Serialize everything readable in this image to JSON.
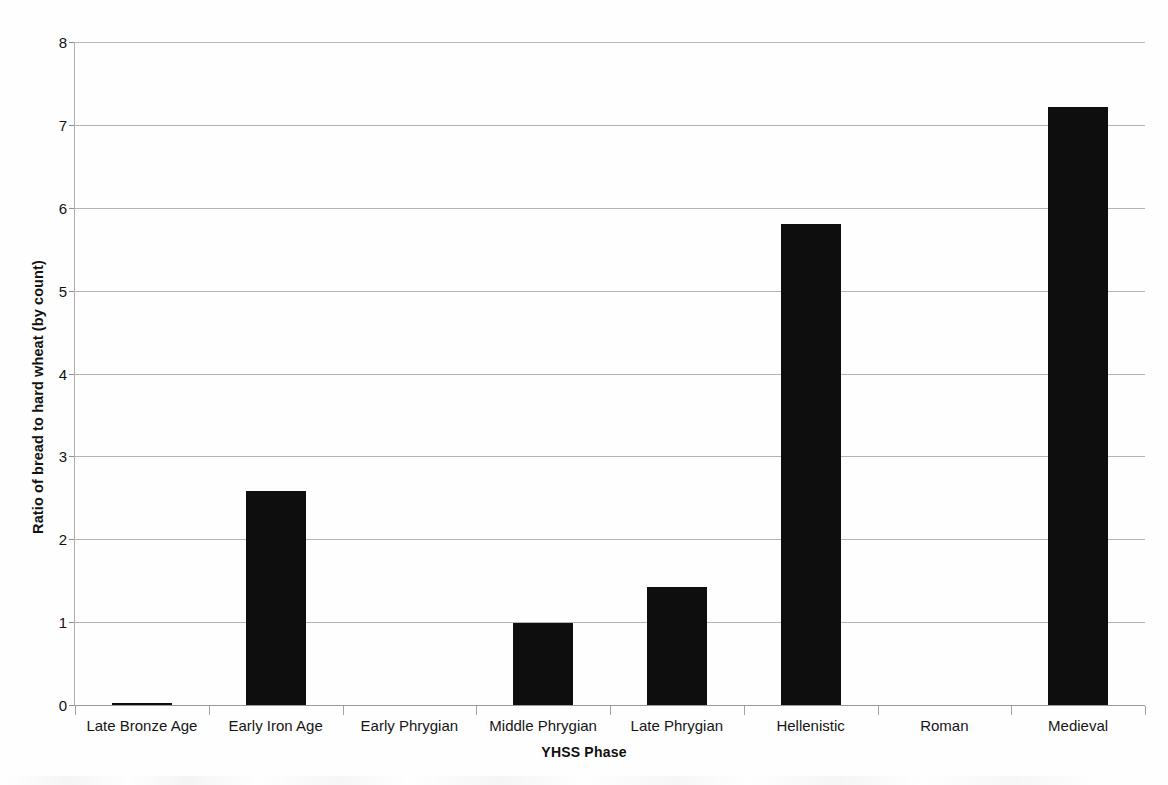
{
  "chart_data": {
    "type": "bar",
    "title": "",
    "xlabel": "YHSS Phase",
    "ylabel": "Ratio of bread to hard wheat (by count)",
    "categories": [
      "Late Bronze Age",
      "Early Iron Age",
      "Early Phrygian",
      "Middle Phrygian",
      "Late Phrygian",
      "Hellenistic",
      "Roman",
      "Medieval"
    ],
    "values": [
      0.03,
      2.58,
      0,
      0.99,
      1.43,
      5.8,
      0,
      7.22
    ],
    "ylim": [
      0,
      8
    ],
    "ytick_labels": [
      "0",
      "1",
      "2",
      "3",
      "4",
      "5",
      "6",
      "7",
      "8"
    ],
    "ytick_values": [
      0,
      1,
      2,
      3,
      4,
      5,
      6,
      7,
      8
    ],
    "grid": "horizontal",
    "legend": "none",
    "bar_color": "#0e0e0e",
    "gridline_color": "#b4b4b4",
    "background_color": "#fefefe"
  }
}
